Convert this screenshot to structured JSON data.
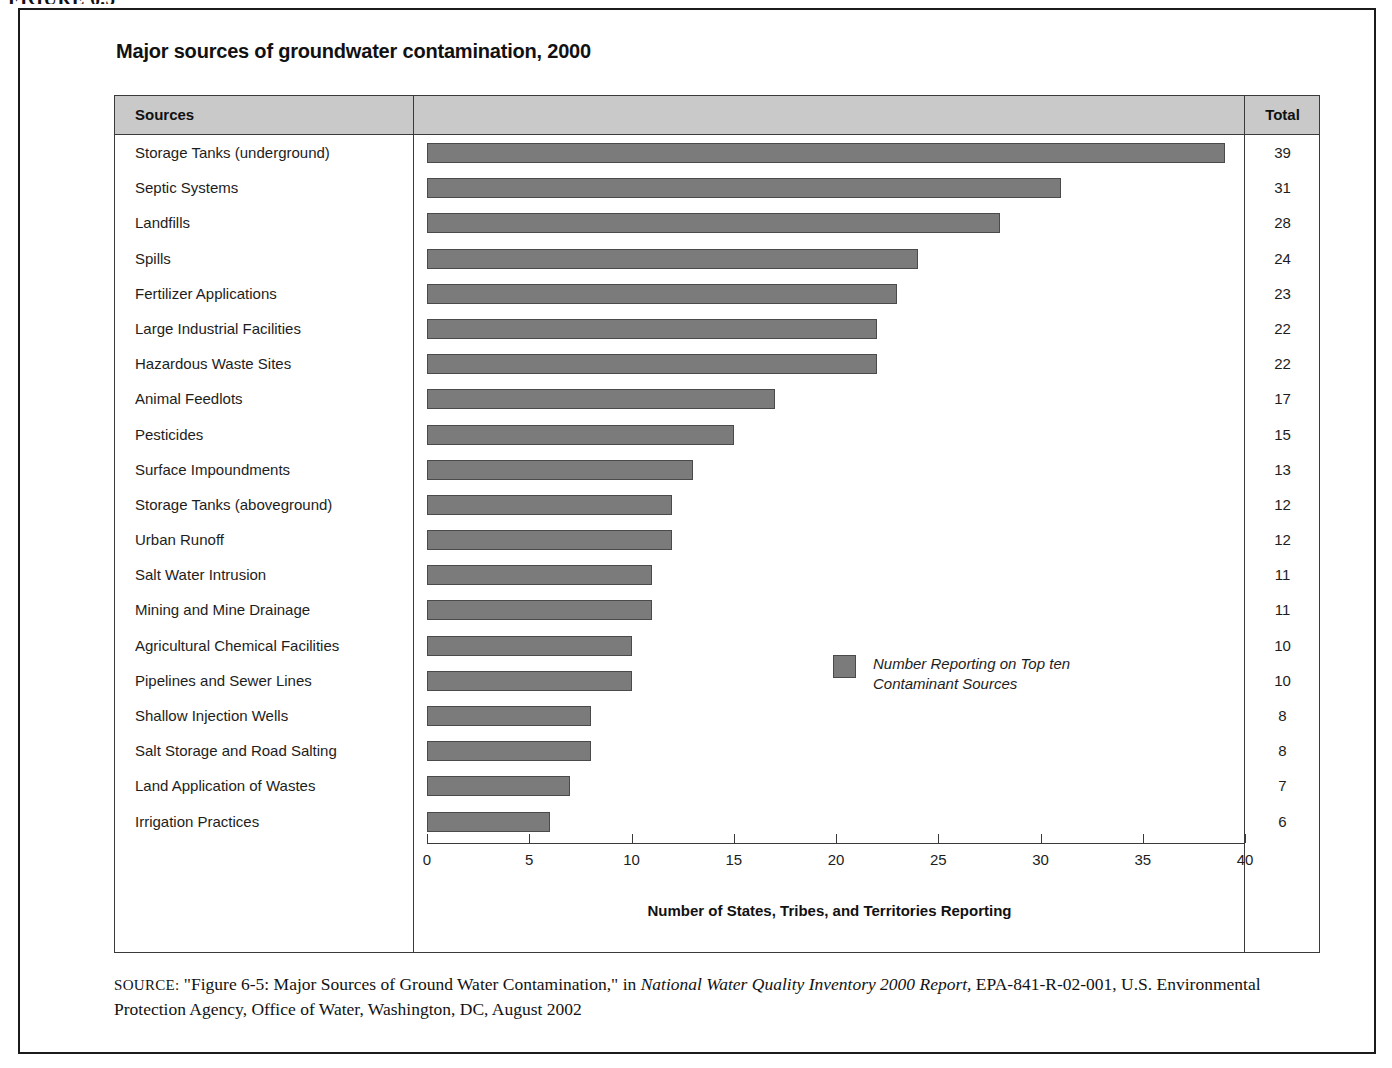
{
  "figure_label": "FIGURE 6.5",
  "chart_title": "Major sources of groundwater contamination, 2000",
  "table": {
    "header_sources": "Sources",
    "header_total": "Total"
  },
  "legend": {
    "label": "Number Reporting on Top ten\nContaminant Sources",
    "swatch_color": "#7b7b7b"
  },
  "source_note": {
    "prefix": "SOURCE:",
    "part1": " \"Figure 6-5: Major Sources of Ground Water Contamination,\" in ",
    "italic_title": "National Water Quality Inventory 2000 Report,",
    "part2": " EPA-841-R-02-001, U.S. Environmental Protection Agency, Office of Water, Washington, DC, August 2002"
  },
  "chart_data": {
    "type": "bar",
    "orientation": "horizontal",
    "title": "Major sources of groundwater contamination, 2000",
    "xlabel": "Number of States, Tribes, and Territories Reporting",
    "ylabel": "",
    "xlim": [
      0,
      40
    ],
    "xticks": [
      0,
      5,
      10,
      15,
      20,
      25,
      30,
      35,
      40
    ],
    "grid": false,
    "legend_position": "inside-right",
    "series_name": "Number Reporting on Top ten Contaminant Sources",
    "bar_color": "#7b7b7b",
    "categories": [
      "Storage Tanks (underground)",
      "Septic Systems",
      "Landfills",
      "Spills",
      "Fertilizer Applications",
      "Large Industrial Facilities",
      "Hazardous Waste Sites",
      "Animal Feedlots",
      "Pesticides",
      "Surface Impoundments",
      "Storage Tanks (aboveground)",
      "Urban Runoff",
      "Salt Water Intrusion",
      "Mining and Mine Drainage",
      "Agricultural Chemical Facilities",
      "Pipelines and Sewer Lines",
      "Shallow Injection Wells",
      "Salt Storage and Road Salting",
      "Land Application of Wastes",
      "Irrigation Practices"
    ],
    "values": [
      39,
      31,
      28,
      24,
      23,
      22,
      22,
      17,
      15,
      13,
      12,
      12,
      11,
      11,
      10,
      10,
      8,
      8,
      7,
      6
    ],
    "totals": [
      "39",
      "31",
      "28",
      "24",
      "23",
      "22",
      "22",
      "17",
      "15",
      "13",
      "12",
      "12",
      "11",
      "11",
      "10",
      "10",
      "8",
      "8",
      "7",
      "6"
    ]
  }
}
